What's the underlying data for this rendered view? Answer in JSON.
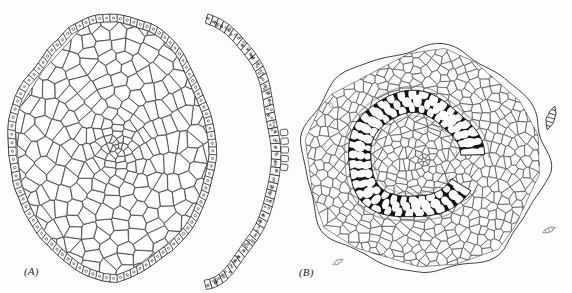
{
  "figure": {
    "kind": "scientific-line-drawing",
    "background_color": "#fdfdfd",
    "ink_color": "#1d1d1d",
    "fill_color": "#ffffff",
    "dark_tissue_color": "#121212",
    "panels": [
      {
        "id": "A",
        "label": "(A)",
        "description": "Transverse section of parenchymatous organ with single-layered epidermis and a detached arc-shaped epidermal strip to the right",
        "center": {
          "x": 117,
          "y": 147
        },
        "radius_x": 108,
        "radius_y": 132,
        "features": [
          {
            "name": "epidermis-layer",
            "cell_count": 96,
            "cell_marker": "dot"
          },
          {
            "name": "cortex-parenchyma",
            "cell_count": 230
          },
          {
            "name": "central-whorl",
            "cell_count": 46
          },
          {
            "name": "detached-epidermal-strip",
            "cell_count": 46,
            "cell_marker": "dots"
          }
        ]
      },
      {
        "id": "B",
        "label": "(B)",
        "description": "Transverse section of a root/stem showing lobed cortex, endodermis, and a C-shaped dark lignified xylem ring surrounding a pith",
        "center": {
          "x": 424,
          "y": 160
        },
        "radius_x": 122,
        "radius_y": 112,
        "features": [
          {
            "name": "outer-cortex",
            "cell_count": 520
          },
          {
            "name": "endodermis-ring",
            "cell_count": 120
          },
          {
            "name": "dark-xylem-ring",
            "shape": "C",
            "gap_angle_deg": 25,
            "vessel_count": 96
          },
          {
            "name": "pith-parenchyma",
            "cell_count": 180
          },
          {
            "name": "detached-fragments",
            "count": 4
          }
        ]
      }
    ]
  },
  "labels": {
    "panel_a": "(A)",
    "panel_b": "(B)"
  }
}
